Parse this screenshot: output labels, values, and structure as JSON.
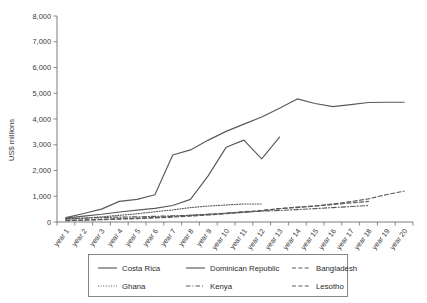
{
  "chart_data": {
    "type": "line",
    "title": "",
    "xlabel": "",
    "ylabel": "US$ millions",
    "ylim": [
      0,
      8000
    ],
    "ytick_values": [
      0,
      1000,
      2000,
      3000,
      4000,
      5000,
      6000,
      7000,
      8000
    ],
    "ytick_labels": [
      "0",
      "1,000",
      "2,000",
      "3,000",
      "4,000",
      "5,000",
      "6,000",
      "7,000",
      "8,000"
    ],
    "grid": false,
    "legend_position": "bottom",
    "legend_columns": 3,
    "categories": [
      "year 1",
      "year 2",
      "year 3",
      "year 4",
      "year 5",
      "year 6",
      "year 7",
      "year 8",
      "year 9",
      "year 10",
      "year 11",
      "year 12",
      "year 13",
      "year 14",
      "year 15",
      "year 16",
      "year 17",
      "year 18",
      "year 19",
      "year 20"
    ],
    "series": [
      {
        "name": "Costa Rica",
        "style": "solid",
        "values": [
          170,
          330,
          500,
          800,
          880,
          1060,
          2600,
          2800,
          3180,
          3520,
          3800,
          4080,
          4420,
          4780,
          4600,
          4480,
          4560,
          4640,
          4650,
          4650
        ]
      },
      {
        "name": "Dominican Republic",
        "style": "solid",
        "values": [
          150,
          230,
          300,
          390,
          460,
          530,
          640,
          880,
          1800,
          2900,
          3180,
          2450,
          3300,
          null,
          null,
          null,
          null,
          null,
          null,
          null
        ]
      },
      {
        "name": "Bangladesh",
        "style": "dashed",
        "values": [
          60,
          80,
          100,
          130,
          150,
          180,
          220,
          260,
          300,
          340,
          400,
          440,
          520,
          560,
          620,
          700,
          790,
          900,
          1060,
          1200
        ]
      },
      {
        "name": "Ghana",
        "style": "dotted",
        "values": [
          100,
          150,
          200,
          260,
          320,
          400,
          470,
          560,
          620,
          660,
          700,
          700,
          null,
          null,
          null,
          null,
          null,
          null,
          null,
          null
        ]
      },
      {
        "name": "Kenya",
        "style": "dashdot",
        "values": [
          130,
          150,
          170,
          190,
          200,
          220,
          240,
          260,
          300,
          340,
          380,
          420,
          450,
          480,
          520,
          560,
          600,
          640,
          null,
          null
        ]
      },
      {
        "name": "Lesotho",
        "style": "dashed",
        "values": [
          50,
          70,
          90,
          110,
          130,
          160,
          190,
          230,
          270,
          320,
          380,
          440,
          520,
          580,
          620,
          680,
          740,
          800,
          null,
          null
        ]
      }
    ]
  },
  "legend": {
    "entries": [
      {
        "label": "Costa Rica",
        "style": "solid"
      },
      {
        "label": "Dominican Republic",
        "style": "solid"
      },
      {
        "label": "Bangladesh",
        "style": "dashed"
      },
      {
        "label": "Ghana",
        "style": "dotted"
      },
      {
        "label": "Kenya",
        "style": "dashdot"
      },
      {
        "label": "Lesotho",
        "style": "dashed"
      }
    ]
  },
  "colors": {
    "line": "#5a5a5a",
    "axis": "#6d6d6d",
    "text": "#3a3a3a",
    "background": "#ffffff"
  }
}
